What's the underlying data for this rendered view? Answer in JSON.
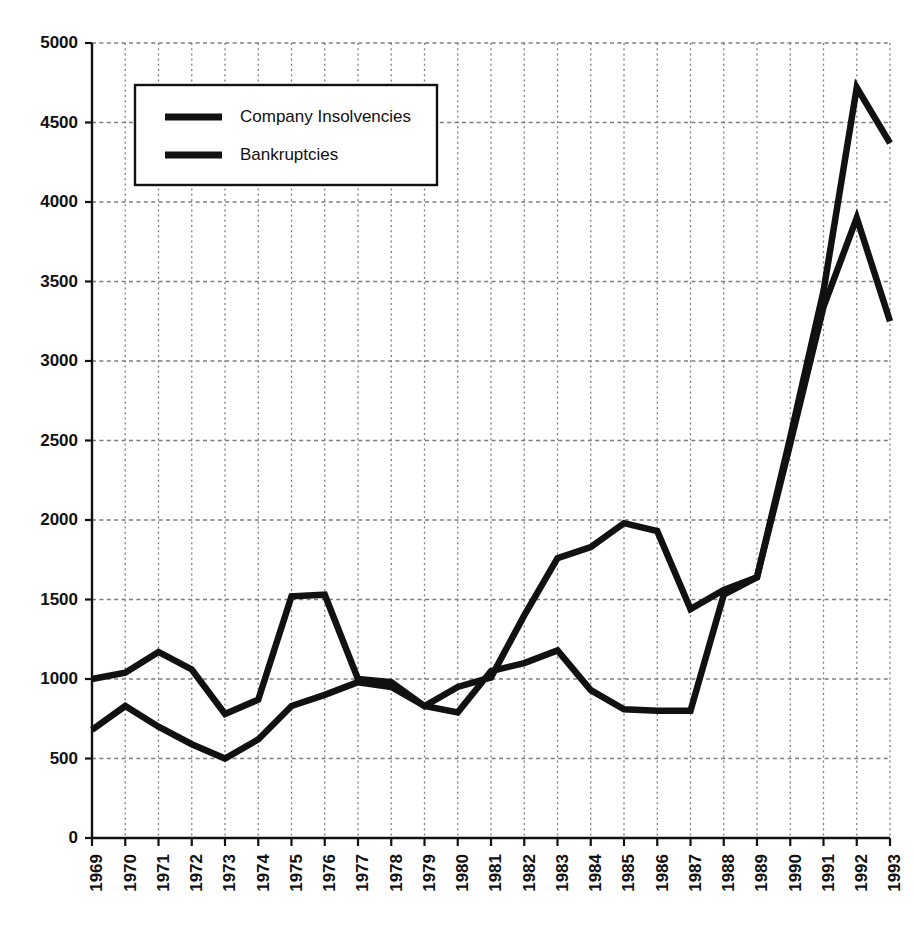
{
  "chart_data": {
    "type": "line",
    "title": "",
    "subtitle": "",
    "xlabel": "",
    "ylabel": "",
    "xlim": [
      1969,
      1993
    ],
    "ylim": [
      0,
      5000
    ],
    "ytick_step": 500,
    "grid": "dotted-both-axes",
    "legend_position": "top-left-inside",
    "categories": [
      1969,
      1970,
      1971,
      1972,
      1973,
      1974,
      1975,
      1976,
      1977,
      1978,
      1979,
      1980,
      1981,
      1982,
      1983,
      1984,
      1985,
      1986,
      1987,
      1988,
      1989,
      1990,
      1991,
      1992,
      1993
    ],
    "xtick_labels": [
      "1969",
      "1970",
      "1971",
      "1972",
      "1973",
      "1974",
      "1975",
      "1976",
      "1977",
      "1978",
      "1979",
      "1980",
      "1981",
      "1982",
      "1983",
      "1984",
      "1985",
      "1986",
      "1987",
      "1988",
      "1989",
      "1990",
      "1991",
      "1992",
      "1993"
    ],
    "ytick_labels": [
      "0",
      "500",
      "1000",
      "1500",
      "2000",
      "2500",
      "3000",
      "3500",
      "4000",
      "4500",
      "5000"
    ],
    "ytick_values": [
      0,
      500,
      1000,
      1500,
      2000,
      2500,
      3000,
      3500,
      4000,
      4500,
      5000
    ],
    "series": [
      {
        "name": "Company Insolvencies",
        "color": "#111111",
        "values": [
          1000,
          1040,
          1170,
          1060,
          780,
          870,
          1520,
          1530,
          1000,
          980,
          830,
          950,
          1010,
          1400,
          1760,
          1830,
          1980,
          1930,
          1440,
          1560,
          1640,
          2520,
          3440,
          4720,
          4370
        ]
      },
      {
        "name": "Bankruptcies",
        "color": "#111111",
        "values": [
          680,
          830,
          700,
          590,
          500,
          620,
          830,
          900,
          980,
          950,
          830,
          790,
          1050,
          1100,
          1180,
          930,
          810,
          800,
          800,
          1530,
          1640,
          2480,
          3340,
          3900,
          3250
        ]
      }
    ]
  },
  "legend": {
    "entries": [
      {
        "label": "Company Insolvencies",
        "swatch": "line-swatch"
      },
      {
        "label": "Bankruptcies",
        "swatch": "line-swatch"
      }
    ]
  },
  "colors": {
    "series_line": "#111111",
    "axis": "#111111",
    "grid": "#7d7d7d",
    "background": "#ffffff",
    "legend_border": "#111111",
    "legend_fill": "#ffffff"
  }
}
